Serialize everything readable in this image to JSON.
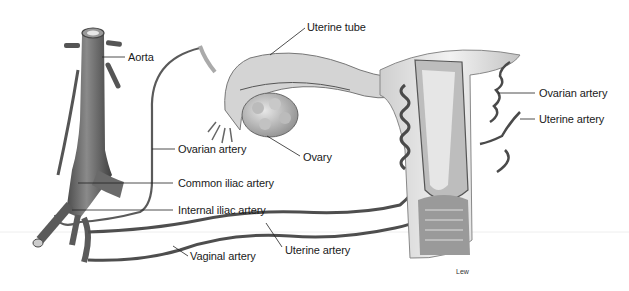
{
  "figure": {
    "labels": {
      "aorta": "Aorta",
      "uterine_tube": "Uterine tube",
      "ovarian_artery_left": "Ovarian artery",
      "ovary": "Ovary",
      "common_iliac_artery": "Common iliac artery",
      "internal_iliac_artery": "Internal iliac artery",
      "uterine_artery_bottom": "Uterine artery",
      "vaginal_artery": "Vaginal artery",
      "ovarian_artery_right": "Ovarian artery",
      "uterine_artery_right": "Uterine artery"
    },
    "credit": "Lew"
  },
  "colors": {
    "vessel": "#5a5a5a",
    "vessel_dark": "#3a3a3a",
    "tissue": "#d8d8d8",
    "tissue_light": "#ececec",
    "leader": "#222222"
  }
}
